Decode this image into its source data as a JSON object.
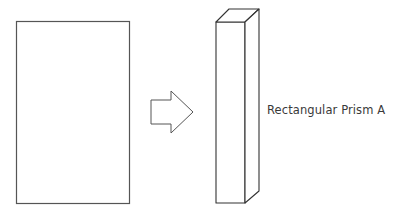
{
  "diagram": {
    "type": "shape-transformation",
    "stroke_color": "#555555",
    "background_color": "#ffffff",
    "source_shape": {
      "name": "rectangle",
      "x": 16,
      "y": 21,
      "width": 113,
      "height": 182
    },
    "arrow": {
      "direction": "right",
      "points": "151,100 171,100 171,91 193,112 171,133 171,124 151,124"
    },
    "result_shape": {
      "name": "rectangular-prism",
      "front_face": "216,22 245,22 245,203 216,203",
      "top_face": "216,22 229,9 259,9 245,22",
      "side_face": "245,22 259,9 259,191 245,203",
      "label": "Rectangular Prism A"
    }
  }
}
